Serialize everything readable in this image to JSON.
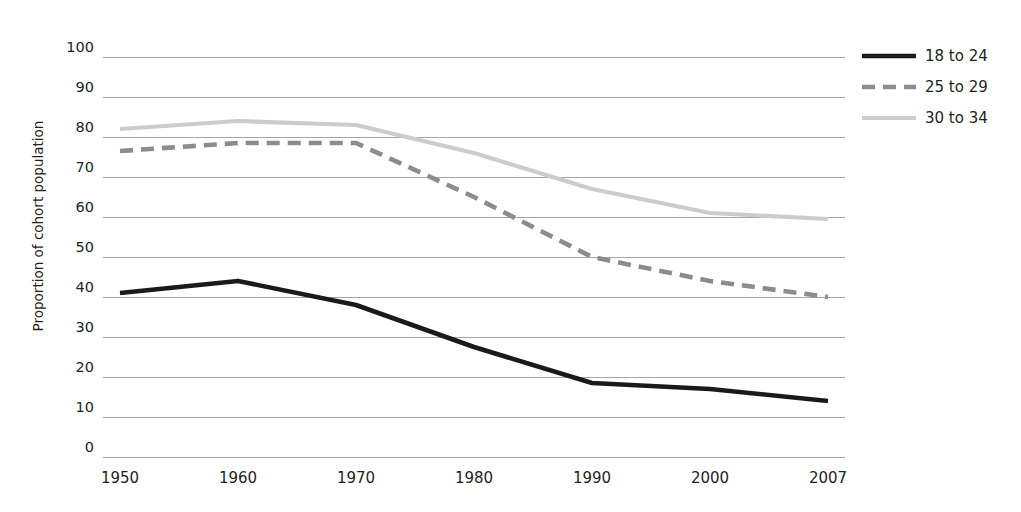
{
  "chart_data": {
    "type": "line",
    "title": "",
    "xlabel": "",
    "ylabel": "Proportion of cohort population",
    "x": [
      1950,
      1960,
      1970,
      1980,
      1990,
      2000,
      2007
    ],
    "categories": [
      "1950",
      "1960",
      "1970",
      "1980",
      "1990",
      "2000",
      "2007"
    ],
    "ylim": [
      0,
      100
    ],
    "yticks": [
      100,
      90,
      80,
      70,
      60,
      50,
      40,
      30,
      20,
      10,
      0
    ],
    "grid": true,
    "legend_position": "right",
    "series": [
      {
        "name": "18 to 24",
        "values": [
          41,
          44,
          38,
          27.5,
          18.5,
          17,
          14
        ],
        "color": "#1a1a1a",
        "style": "solid",
        "width": 4.6
      },
      {
        "name": "25 to 29",
        "values": [
          76.5,
          78.5,
          78.5,
          65,
          50,
          44,
          40
        ],
        "color": "#8c8c8c",
        "style": "dashed",
        "width": 4.6
      },
      {
        "name": "30 to 34",
        "values": [
          82,
          84,
          83,
          76,
          67,
          61,
          59.5
        ],
        "color": "#cccccc",
        "style": "solid",
        "width": 4.2
      }
    ]
  },
  "legend": {
    "items": [
      {
        "label": "18 to 24",
        "swatch": "solid-black-line-icon"
      },
      {
        "label": "25 to 29",
        "swatch": "dashed-gray-line-icon"
      },
      {
        "label": "30 to 34",
        "swatch": "solid-lightgray-line-icon"
      }
    ]
  },
  "colors": {
    "gridline": "#a6a6a6",
    "text": "#231f20",
    "background": "#ffffff"
  }
}
